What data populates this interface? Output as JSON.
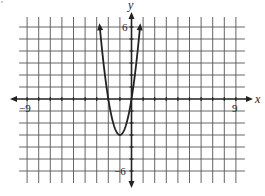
{
  "chart_data": {
    "type": "line",
    "title": "",
    "xlabel": "x",
    "ylabel": "y",
    "xlim": [
      -9,
      9
    ],
    "ylim": [
      -6,
      6
    ],
    "grid": true,
    "grid_step": 1,
    "tick_labels": {
      "x": [
        {
          "value": -9,
          "label": "−9"
        },
        {
          "value": 9,
          "label": "9"
        }
      ],
      "y": [
        {
          "value": 6,
          "label": "6"
        },
        {
          "value": -6,
          "label": "−6"
        }
      ]
    },
    "series": [
      {
        "name": "parabola",
        "equation": "y = 3x^2 + 6x",
        "vertex": [
          -1,
          -3
        ],
        "roots": [
          -2,
          0
        ],
        "opens": "up",
        "x": [
          -2.73,
          -2.5,
          -2,
          -1.5,
          -1,
          -0.5,
          0,
          0.5,
          0.73
        ],
        "values": [
          6.0,
          3.75,
          0,
          -2.25,
          -3,
          -2.25,
          0,
          3.75,
          6.0
        ],
        "arrows_at_ends": true
      }
    ],
    "legend": null
  },
  "labels": {
    "x_axis": "x",
    "y_axis": "y",
    "x_min": "−9",
    "x_max": "9",
    "y_max": "6",
    "y_min": "−6"
  },
  "colors": {
    "grid": "#555555",
    "axis": "#222222",
    "curve": "#222222",
    "background": "#ffffff"
  }
}
